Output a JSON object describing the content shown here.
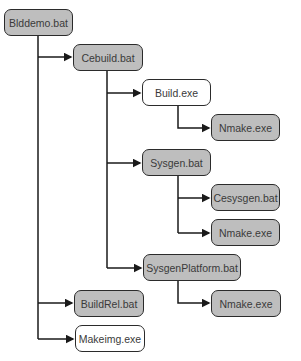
{
  "diagram": {
    "type": "call-tree",
    "colors": {
      "script_fill": "#bebebe",
      "exe_fill": "#ffffff",
      "border": "#2b2b2b",
      "line": "#1a1a1a"
    },
    "nodes": [
      {
        "id": "blddemo",
        "label": "Blddemo.bat",
        "fill": "gray",
        "x": 4,
        "y": 9,
        "w": 69
      },
      {
        "id": "cebuild",
        "label": "Cebuild.bat",
        "fill": "gray",
        "x": 73,
        "y": 44,
        "w": 70
      },
      {
        "id": "build",
        "label": "Build.exe",
        "fill": "white",
        "x": 142,
        "y": 79,
        "w": 69
      },
      {
        "id": "nmake1",
        "label": "Nmake.exe",
        "fill": "gray",
        "x": 211,
        "y": 114,
        "w": 69
      },
      {
        "id": "sysgen",
        "label": "Sysgen.bat",
        "fill": "gray",
        "x": 142,
        "y": 149,
        "w": 69
      },
      {
        "id": "cesysgen",
        "label": "Cesysgen.bat",
        "fill": "gray",
        "x": 211,
        "y": 184,
        "w": 69
      },
      {
        "id": "nmake2",
        "label": "Nmake.exe",
        "fill": "gray",
        "x": 211,
        "y": 219,
        "w": 69
      },
      {
        "id": "sysgenplatform",
        "label": "SysgenPlatform.bat",
        "fill": "gray",
        "x": 143,
        "y": 254,
        "w": 98
      },
      {
        "id": "nmake3",
        "label": "Nmake.exe",
        "fill": "gray",
        "x": 211,
        "y": 290,
        "w": 70
      },
      {
        "id": "buildrel",
        "label": "BuildRel.bat",
        "fill": "gray",
        "x": 74,
        "y": 290,
        "w": 70
      },
      {
        "id": "makeimg",
        "label": "Makeimg.exe",
        "fill": "white",
        "x": 75,
        "y": 325,
        "w": 70
      }
    ],
    "edges": [
      {
        "from": "blddemo",
        "to": "cebuild"
      },
      {
        "from": "blddemo",
        "to": "buildrel"
      },
      {
        "from": "blddemo",
        "to": "makeimg"
      },
      {
        "from": "cebuild",
        "to": "build"
      },
      {
        "from": "cebuild",
        "to": "sysgen"
      },
      {
        "from": "cebuild",
        "to": "sysgenplatform"
      },
      {
        "from": "build",
        "to": "nmake1"
      },
      {
        "from": "sysgen",
        "to": "cesysgen"
      },
      {
        "from": "sysgen",
        "to": "nmake2"
      },
      {
        "from": "sysgenplatform",
        "to": "nmake3"
      }
    ]
  }
}
